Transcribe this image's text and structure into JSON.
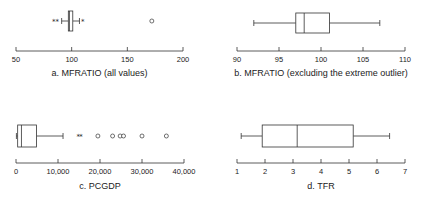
{
  "chart_data": [
    {
      "type": "boxplot",
      "panel": "a",
      "title": "a.  MFRATIO (all values)",
      "xlabel": "MFRATIO",
      "xlim": [
        50,
        200
      ],
      "ticks": [
        50,
        100,
        150,
        200
      ],
      "tick_labels": [
        "50",
        "100",
        "150",
        "200"
      ],
      "whisker_low": 91,
      "q1": 97,
      "median": 98,
      "q3": 101,
      "whisker_high": 107,
      "outliers_star": [
        84,
        87,
        110
      ],
      "outliers_circle": [
        172
      ]
    },
    {
      "type": "boxplot",
      "panel": "b",
      "title": "b.  MFRATIO (excluding the extreme outlier)",
      "xlabel": "MFRATIO",
      "xlim": [
        90,
        110
      ],
      "ticks": [
        90,
        95,
        100,
        105,
        110
      ],
      "tick_labels": [
        "90",
        "95",
        "100",
        "105",
        "110"
      ],
      "whisker_low": 92,
      "q1": 97,
      "median": 98,
      "q3": 101,
      "whisker_high": 107,
      "outliers_star": [],
      "outliers_circle": []
    },
    {
      "type": "boxplot",
      "panel": "c",
      "title": "c.  PCGDP",
      "xlabel": "PCGDP",
      "xlim": [
        0,
        40000
      ],
      "ticks": [
        0,
        10000,
        20000,
        30000,
        40000
      ],
      "tick_labels": [
        "0",
        "10,000",
        "20,000",
        "30,000",
        "40,000"
      ],
      "whisker_low": 100,
      "q1": 400,
      "median": 1300,
      "q3": 4900,
      "whisker_high": 11200,
      "outliers_star": [
        14800,
        15500
      ],
      "outliers_circle": [
        19500,
        23000,
        24800,
        25600,
        30000,
        35800
      ]
    },
    {
      "type": "boxplot",
      "panel": "d",
      "title": "d.  TFR",
      "xlabel": "TFR",
      "xlim": [
        1,
        7
      ],
      "ticks": [
        1,
        2,
        3,
        4,
        5,
        6,
        7
      ],
      "tick_labels": [
        "1",
        "2",
        "3",
        "4",
        "5",
        "6",
        "7"
      ],
      "whisker_low": 1.15,
      "q1": 1.9,
      "median": 3.15,
      "q3": 5.15,
      "whisker_high": 6.45,
      "outliers_star": [],
      "outliers_circle": []
    }
  ]
}
